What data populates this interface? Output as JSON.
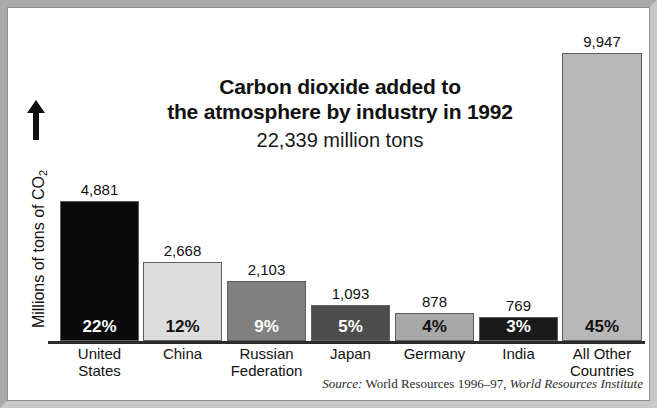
{
  "figure": {
    "title_line_1": "Carbon dioxide added to",
    "title_line_2": "the atmosphere by industry in 1992",
    "subtitle": "22,339 million tons",
    "y_axis_label_text": "Millions of tons of CO",
    "y_axis_label_sub": "2",
    "y_axis_arrow_icon": "up-arrow-icon",
    "source_prefix": "Source:",
    "source_work": "World Resources 1996–97,",
    "source_publisher": "World Resources Institute",
    "frame_color": "#b9b9b9"
  },
  "chart_data": {
    "type": "bar",
    "title": "Carbon dioxide added to the atmosphere by industry in 1992",
    "subtitle": "22,339 million tons",
    "xlabel": "",
    "ylabel": "Millions of tons of CO2",
    "ylim": [
      0,
      10400
    ],
    "grid": false,
    "legend": "none",
    "total": 22339,
    "units": "million tons",
    "year": 1992,
    "categories": [
      "United States",
      "China",
      "Russian Federation",
      "Japan",
      "Germany",
      "India",
      "All Other Countries"
    ],
    "category_lines": [
      [
        "United",
        "States"
      ],
      [
        "China",
        ""
      ],
      [
        "Russian",
        "Federation"
      ],
      [
        "Japan",
        ""
      ],
      [
        "Germany",
        ""
      ],
      [
        "India",
        ""
      ],
      [
        "All Other",
        "Countries"
      ]
    ],
    "values": [
      4881,
      2668,
      2103,
      1093,
      878,
      769,
      9947
    ],
    "value_labels": [
      "4,881",
      "2,668",
      "2,103",
      "1,093",
      "878",
      "769",
      "9,947"
    ],
    "percent_values": [
      22,
      12,
      9,
      5,
      4,
      3,
      45
    ],
    "percent_labels": [
      "22%",
      "12%",
      "9%",
      "5%",
      "4%",
      "3%",
      "45%"
    ],
    "bar_fill_colors": [
      "#0a0a0a",
      "#dddddd",
      "#808080",
      "#4d4d4d",
      "#a8a8a8",
      "#1a1a1a",
      "#b8b8b8"
    ],
    "percent_text_colors": [
      "#ffffff",
      "#111111",
      "#ffffff",
      "#ffffff",
      "#111111",
      "#ffffff",
      "#111111"
    ]
  },
  "layout": {
    "bars": [
      {
        "left": 60,
        "width": 79,
        "top": 201,
        "height": 140
      },
      {
        "left": 143,
        "width": 79,
        "top": 262,
        "height": 79
      },
      {
        "left": 227,
        "width": 79,
        "top": 281,
        "height": 60
      },
      {
        "left": 311,
        "width": 79,
        "top": 305,
        "height": 36
      },
      {
        "left": 395,
        "width": 79,
        "top": 313,
        "height": 28
      },
      {
        "left": 479,
        "width": 79,
        "top": 317,
        "height": 24
      },
      {
        "left": 562,
        "width": 80,
        "top": 53,
        "height": 288
      }
    ]
  }
}
